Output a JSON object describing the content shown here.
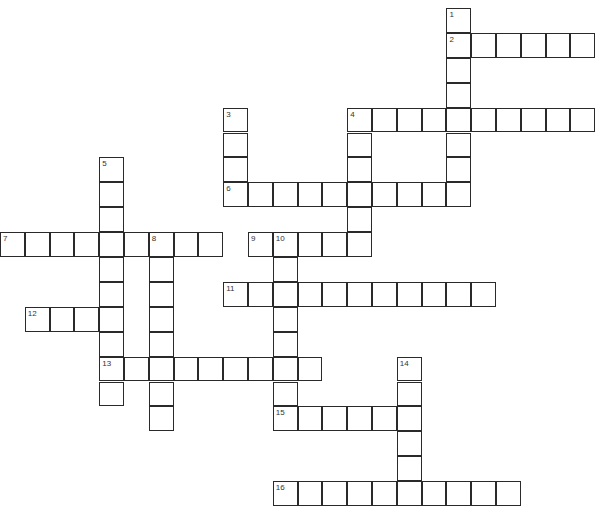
{
  "puzzle": {
    "type": "crossword",
    "cell_width": 24.8,
    "cell_height": 24.9,
    "origin_x": 0,
    "origin_y": 8,
    "entries": [
      {
        "number": "1",
        "direction": "down",
        "col": 18,
        "row": 0,
        "length": 8
      },
      {
        "number": "2",
        "direction": "across",
        "col": 18,
        "row": 1,
        "length": 6
      },
      {
        "number": "3",
        "direction": "down",
        "col": 9,
        "row": 4,
        "length": 4
      },
      {
        "number": "4",
        "direction": "across",
        "col": 14,
        "row": 4,
        "length": 10
      },
      {
        "number": "4",
        "direction": "down",
        "col": 14,
        "row": 4,
        "length": 6
      },
      {
        "number": "5",
        "direction": "down",
        "col": 4,
        "row": 6,
        "length": 10
      },
      {
        "number": "6",
        "direction": "across",
        "col": 9,
        "row": 7,
        "length": 10
      },
      {
        "number": "7",
        "direction": "across",
        "col": 0,
        "row": 9,
        "length": 9
      },
      {
        "number": "8",
        "direction": "down",
        "col": 6,
        "row": 9,
        "length": 8
      },
      {
        "number": "9",
        "direction": "across",
        "col": 10,
        "row": 9,
        "length": 5
      },
      {
        "number": "10",
        "direction": "down",
        "col": 11,
        "row": 9,
        "length": 8
      },
      {
        "number": "11",
        "direction": "across",
        "col": 9,
        "row": 11,
        "length": 11
      },
      {
        "number": "12",
        "direction": "across",
        "col": 1,
        "row": 12,
        "length": 4
      },
      {
        "number": "13",
        "direction": "across",
        "col": 4,
        "row": 14,
        "length": 9
      },
      {
        "number": "14",
        "direction": "down",
        "col": 16,
        "row": 14,
        "length": 6
      },
      {
        "number": "15",
        "direction": "across",
        "col": 11,
        "row": 16,
        "length": 6
      },
      {
        "number": "16",
        "direction": "across",
        "col": 11,
        "row": 19,
        "length": 10
      }
    ]
  }
}
